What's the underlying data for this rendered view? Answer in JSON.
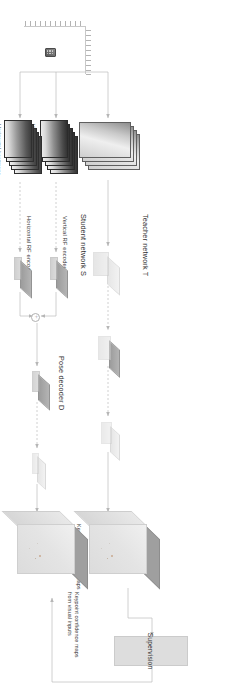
{
  "figure": {
    "orientation_deg": 90,
    "background": "#ffffff",
    "line_color": "#b6b6b6",
    "text_color": "#3b3b3b"
  },
  "labels": {
    "supervision": "Supervision",
    "teacher_network": "Teacher network T",
    "student_network": "Student network S",
    "vertical_rf_encoder": "Vertical RF encoder E",
    "vertical_rf_encoder_sub": "v",
    "horizontal_rf_encoder": "Horizontal RF encoder E",
    "horizontal_rf_encoder_sub": "h",
    "pose_decoder": "Pose decoder D",
    "keypoint_maps_teacher": "Keypoint confidence maps\nfrom visual inputs",
    "keypoint_maps_student": "Keypoint confidence maps\nfrom visual inputs",
    "rgb_frames": "RGB frames",
    "vertical_heatmaps": "Vertical heatmaps",
    "horizontal_heatmaps": "Horizontal heatmaps",
    "merge_operator": "+"
  },
  "nodes": [
    {
      "id": "rgb-frames",
      "kind": "frame-stack",
      "label": "RGB frames",
      "branch": "teacher"
    },
    {
      "id": "teacher-conv-1",
      "kind": "conv-slab",
      "label": "",
      "branch": "teacher"
    },
    {
      "id": "teacher-conv-2",
      "kind": "conv-slab",
      "label": "",
      "branch": "teacher"
    },
    {
      "id": "teacher-conv-3",
      "kind": "conv-slab",
      "label": "",
      "branch": "teacher"
    },
    {
      "id": "teacher-output-volume",
      "kind": "cube",
      "label": "Keypoint confidence maps from visual inputs",
      "branch": "teacher"
    },
    {
      "id": "vertical-heatmaps",
      "kind": "frame-stack",
      "label": "Vertical heatmaps",
      "branch": "student"
    },
    {
      "id": "horizontal-heatmaps",
      "kind": "frame-stack",
      "label": "Horizontal heatmaps",
      "branch": "student"
    },
    {
      "id": "vertical-encoder-slab",
      "kind": "conv-slab",
      "label": "Vertical RF encoder Ev",
      "branch": "student"
    },
    {
      "id": "horizontal-encoder-slab",
      "kind": "conv-slab",
      "label": "Horizontal RF encoder Eh",
      "branch": "student"
    },
    {
      "id": "feature-merge",
      "kind": "operator",
      "label": "+",
      "branch": "student"
    },
    {
      "id": "decoder-slab-1",
      "kind": "conv-slab",
      "label": "",
      "branch": "student"
    },
    {
      "id": "decoder-slab-2",
      "kind": "conv-slab",
      "label": "",
      "branch": "student"
    },
    {
      "id": "student-output-volume",
      "kind": "cube",
      "label": "Keypoint confidence maps from visual inputs",
      "branch": "student"
    },
    {
      "id": "supervision-box",
      "kind": "box",
      "label": "Supervision",
      "branch": "loss"
    },
    {
      "id": "antenna-array",
      "kind": "sensor",
      "label": "",
      "branch": "input"
    }
  ],
  "edges": [
    {
      "from": "antenna-array",
      "to": "rgb-frames",
      "style": "solid"
    },
    {
      "from": "antenna-array",
      "to": "vertical-heatmaps",
      "style": "solid"
    },
    {
      "from": "antenna-array",
      "to": "horizontal-heatmaps",
      "style": "solid"
    },
    {
      "from": "rgb-frames",
      "to": "teacher-conv-1",
      "style": "solid"
    },
    {
      "from": "teacher-conv-1",
      "to": "teacher-conv-2",
      "style": "dashed"
    },
    {
      "from": "teacher-conv-2",
      "to": "teacher-conv-3",
      "style": "dashed"
    },
    {
      "from": "teacher-conv-3",
      "to": "teacher-output-volume",
      "style": "solid"
    },
    {
      "from": "vertical-heatmaps",
      "to": "vertical-encoder-slab",
      "style": "dashed"
    },
    {
      "from": "horizontal-heatmaps",
      "to": "horizontal-encoder-slab",
      "style": "dashed"
    },
    {
      "from": "vertical-encoder-slab",
      "to": "feature-merge",
      "style": "solid"
    },
    {
      "from": "horizontal-encoder-slab",
      "to": "feature-merge",
      "style": "solid"
    },
    {
      "from": "feature-merge",
      "to": "decoder-slab-1",
      "style": "solid"
    },
    {
      "from": "decoder-slab-1",
      "to": "decoder-slab-2",
      "style": "dashed"
    },
    {
      "from": "decoder-slab-2",
      "to": "student-output-volume",
      "style": "solid"
    },
    {
      "from": "teacher-output-volume",
      "to": "supervision-box",
      "style": "solid"
    },
    {
      "from": "supervision-box",
      "to": "student-output-volume",
      "style": "solid"
    }
  ],
  "antenna_array": {
    "horizontal_elements": 10,
    "vertical_elements": 12,
    "sensor_label": ""
  }
}
